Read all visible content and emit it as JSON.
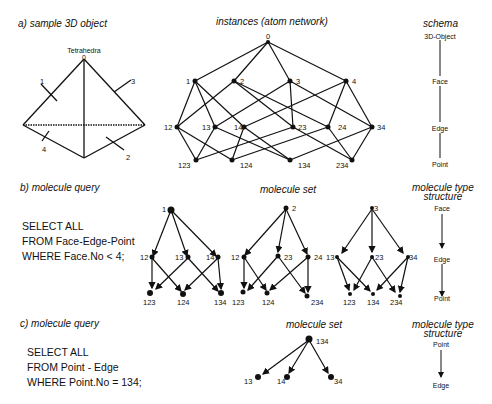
{
  "section_a": {
    "heading": "a)   sample 3D object",
    "object_label": "Tetrahedra",
    "apex_label": "0",
    "face_labels": [
      "1",
      "2",
      "3",
      "4"
    ],
    "network_title": "instances  (atom   network)",
    "schema_title": "schema",
    "schema_levels": [
      "3D-Object",
      "Face",
      "Edge",
      "Point"
    ],
    "network": {
      "root": "0",
      "faces": [
        "1",
        "2",
        "3",
        "4"
      ],
      "edges": [
        "12",
        "13",
        "14",
        "23",
        "24",
        "34"
      ],
      "points": [
        "123",
        "124",
        "134",
        "234"
      ]
    }
  },
  "section_b": {
    "heading": "b)   molecule  query",
    "query": [
      "SELECT ALL",
      "FROM Face-Edge-Point",
      "WHERE Face.No < 4;"
    ],
    "set_title": "molecule set",
    "type_title_1": "molecule type",
    "type_title_2": "structure",
    "type_levels": [
      "Face",
      "Edge",
      "Point"
    ],
    "molecules": [
      {
        "root": "1",
        "edges": [
          "12",
          "13",
          "14"
        ],
        "points": [
          "123",
          "124",
          "134"
        ]
      },
      {
        "root": "2",
        "edges": [
          "12",
          "23",
          "24"
        ],
        "points": [
          "123",
          "124",
          "234"
        ]
      },
      {
        "root": "3",
        "edges": [
          "13",
          "23",
          "34"
        ],
        "points": [
          "123",
          "134",
          "234"
        ]
      }
    ]
  },
  "section_c": {
    "heading": "c)   molecule  query",
    "query": [
      "SELECT ALL",
      "FROM Point - Edge",
      "WHERE Point.No = 134;"
    ],
    "set_title": "molecule set",
    "type_title_1": "molecule type",
    "type_title_2": "structure",
    "type_levels": [
      "Point",
      "Edge"
    ],
    "molecule": {
      "root": "134",
      "edges": [
        "13",
        "14",
        "34"
      ]
    }
  }
}
